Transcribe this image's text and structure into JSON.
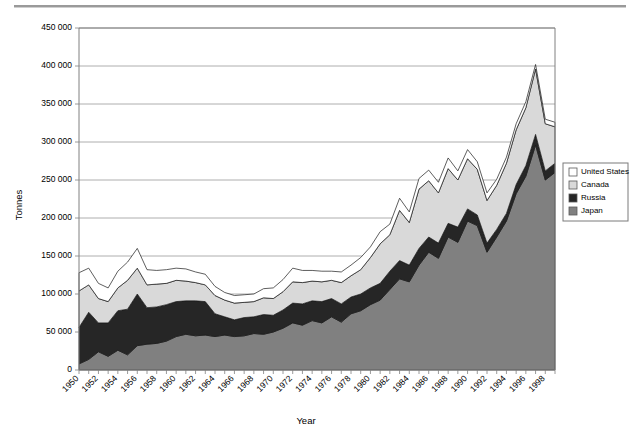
{
  "chart_data": {
    "type": "area",
    "title": "",
    "xlabel": "Year",
    "ylabel": "Tonnes",
    "stacked": true,
    "grid": true,
    "legend_position": "right",
    "ylim": [
      0,
      450000
    ],
    "ytick_values": [
      0,
      50000,
      100000,
      150000,
      200000,
      250000,
      300000,
      350000,
      400000,
      450000
    ],
    "ytick_labels": [
      "0",
      "50 000",
      "100 000",
      "150 000",
      "200 000",
      "250 000",
      "300 000",
      "350 000",
      "400 000",
      "450 000"
    ],
    "xlim": [
      1950,
      1999
    ],
    "x": [
      1950,
      1951,
      1952,
      1953,
      1954,
      1955,
      1956,
      1957,
      1958,
      1959,
      1960,
      1961,
      1962,
      1963,
      1964,
      1965,
      1966,
      1967,
      1968,
      1969,
      1970,
      1971,
      1972,
      1973,
      1974,
      1975,
      1976,
      1977,
      1978,
      1979,
      1980,
      1981,
      1982,
      1983,
      1984,
      1985,
      1986,
      1987,
      1988,
      1989,
      1990,
      1991,
      1992,
      1993,
      1994,
      1995,
      1996,
      1997,
      1998,
      1999
    ],
    "xtick_labels": [
      "1950",
      "1952",
      "1954",
      "1956",
      "1958",
      "1960",
      "1962",
      "1964",
      "1966",
      "1968",
      "1970",
      "1972",
      "1974",
      "1976",
      "1978",
      "1980",
      "1982",
      "1984",
      "1986",
      "1988",
      "1990",
      "1992",
      "1994",
      "1996",
      "1998"
    ],
    "xtick_label_rotation": -45,
    "series": [
      {
        "name": "Japan",
        "color": "#808080",
        "stack_order": 1,
        "values": [
          8000,
          14000,
          24000,
          18000,
          26000,
          20000,
          32000,
          34000,
          35000,
          38000,
          44000,
          47000,
          45000,
          46000,
          44000,
          46000,
          44000,
          45000,
          48000,
          47000,
          50000,
          55000,
          62000,
          59000,
          65000,
          62000,
          70000,
          63000,
          74000,
          78000,
          86000,
          92000,
          106000,
          120000,
          116000,
          138000,
          155000,
          147000,
          175000,
          168000,
          196000,
          190000,
          155000,
          175000,
          196000,
          232000,
          255000,
          296000,
          250000,
          260000
        ]
      },
      {
        "name": "Russia",
        "color": "#262626",
        "stack_order": 2,
        "values": [
          48000,
          62000,
          38000,
          44000,
          52000,
          60000,
          68000,
          48000,
          48000,
          48000,
          46000,
          44000,
          46000,
          44000,
          30000,
          24000,
          22000,
          24000,
          22000,
          26000,
          22000,
          24000,
          26000,
          28000,
          26000,
          28000,
          24000,
          24000,
          22000,
          22000,
          22000,
          22000,
          24000,
          24000,
          22000,
          22000,
          20000,
          20000,
          18000,
          20000,
          16000,
          14000,
          12000,
          10000,
          10000,
          12000,
          14000,
          14000,
          12000,
          12000
        ]
      },
      {
        "name": "Canada",
        "color": "#d9d9d9",
        "stack_order": 3,
        "values": [
          48000,
          36000,
          32000,
          28000,
          30000,
          38000,
          34000,
          30000,
          30000,
          28000,
          28000,
          26000,
          24000,
          22000,
          24000,
          22000,
          22000,
          20000,
          20000,
          22000,
          22000,
          24000,
          28000,
          28000,
          26000,
          26000,
          24000,
          28000,
          28000,
          32000,
          40000,
          52000,
          48000,
          66000,
          56000,
          78000,
          74000,
          66000,
          72000,
          62000,
          66000,
          60000,
          56000,
          58000,
          66000,
          72000,
          76000,
          86000,
          62000,
          48000
        ]
      },
      {
        "name": "United States",
        "color": "#ffffff",
        "stack_order": 4,
        "values": [
          24000,
          22000,
          20000,
          18000,
          22000,
          24000,
          26000,
          20000,
          18000,
          18000,
          16000,
          16000,
          14000,
          14000,
          12000,
          10000,
          10000,
          10000,
          10000,
          12000,
          14000,
          16000,
          18000,
          16000,
          14000,
          14000,
          12000,
          14000,
          14000,
          16000,
          14000,
          16000,
          14000,
          16000,
          14000,
          14000,
          14000,
          14000,
          14000,
          12000,
          12000,
          10000,
          10000,
          8000,
          8000,
          8000,
          8000,
          6000,
          6000,
          6000
        ]
      }
    ]
  },
  "legend": {
    "items": [
      {
        "label": "United States",
        "color": "#ffffff"
      },
      {
        "label": "Canada",
        "color": "#d9d9d9"
      },
      {
        "label": "Russia",
        "color": "#262626"
      },
      {
        "label": "Japan",
        "color": "#808080"
      }
    ]
  }
}
